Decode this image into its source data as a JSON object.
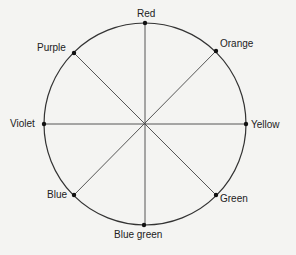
{
  "diagram": {
    "type": "color-wheel",
    "center": [
      145,
      124
    ],
    "radius": 101,
    "colors": {
      "line": "#333333",
      "background": "#f4f4f2"
    },
    "labels": {
      "red": "Red",
      "orange": "Orange",
      "yellow": "Yellow",
      "green": "Green",
      "blue_green": "Blue green",
      "blue": "Blue",
      "violet": "Violet",
      "purple": "Purple"
    }
  }
}
